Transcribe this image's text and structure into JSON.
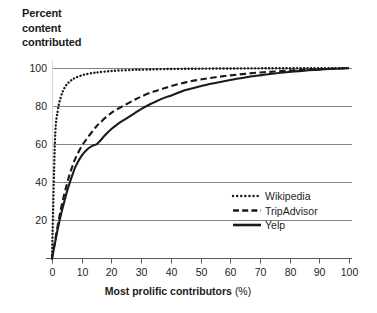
{
  "chart_data": {
    "type": "line",
    "title": "Percent content contributed",
    "title_lines": [
      "Percent",
      "content",
      "contributed"
    ],
    "xlabel": "Most prolific contributors",
    "xlabel_unit": "(%)",
    "ylabel": "Percent content contributed",
    "xlim": [
      0,
      100
    ],
    "ylim": [
      0,
      104
    ],
    "grid": "horizontal",
    "legend_position": "bottom-right",
    "x_ticks": [
      0,
      10,
      20,
      30,
      40,
      50,
      60,
      70,
      80,
      90,
      100
    ],
    "x_tick_labels": [
      "0",
      "10",
      "20",
      "30",
      "40",
      "50",
      "60",
      "70",
      "80",
      "90",
      "100"
    ],
    "y_ticks": [
      20,
      40,
      60,
      80,
      100
    ],
    "y_tick_labels": [
      "20",
      "40",
      "60",
      "80",
      "100"
    ],
    "x": [
      0,
      1,
      2,
      3,
      4,
      5,
      6,
      7,
      8,
      10,
      12,
      14,
      15,
      16,
      18,
      20,
      22,
      25,
      28,
      30,
      33,
      35,
      38,
      40,
      45,
      50,
      55,
      60,
      65,
      70,
      75,
      80,
      85,
      90,
      95,
      100
    ],
    "series": [
      {
        "name": "Wikipedia",
        "style": "dotted",
        "color": "#1a1a1a",
        "values": [
          0,
          62,
          78,
          85,
          89,
          91.5,
          93,
          94.2,
          95,
          96.2,
          97,
          97.5,
          97.7,
          97.9,
          98.2,
          98.5,
          98.7,
          98.9,
          99.1,
          99.2,
          99.3,
          99.4,
          99.5,
          99.55,
          99.65,
          99.72,
          99.78,
          99.82,
          99.86,
          99.89,
          99.92,
          99.94,
          99.96,
          99.97,
          99.99,
          100
        ]
      },
      {
        "name": "TripAdvisor",
        "style": "dashed",
        "color": "#1a1a1a",
        "values": [
          0,
          9,
          18,
          26,
          33,
          39,
          44.5,
          49,
          53,
          59,
          63.5,
          67.5,
          69.5,
          71,
          74,
          76.5,
          78.5,
          81,
          83.5,
          85,
          87,
          88,
          89.5,
          90.5,
          92.5,
          94,
          95.2,
          96.2,
          97,
          97.7,
          98.2,
          98.7,
          99.1,
          99.4,
          99.7,
          100
        ]
      },
      {
        "name": "Yelp",
        "style": "solid",
        "color": "#1a1a1a",
        "values": [
          0,
          8,
          16,
          23,
          29,
          35,
          40,
          44.5,
          48.5,
          54,
          57.5,
          59.5,
          60,
          61.5,
          65,
          68,
          70.5,
          73.5,
          76.5,
          78.5,
          81,
          82.5,
          84.5,
          85.5,
          88.5,
          90.5,
          92.2,
          93.8,
          95.1,
          96.2,
          97.2,
          98,
          98.7,
          99.2,
          99.7,
          100
        ]
      }
    ]
  },
  "legend": {
    "items": [
      {
        "label": "Wikipedia",
        "style": "dotted"
      },
      {
        "label": "TripAdvisor",
        "style": "dashed"
      },
      {
        "label": "Yelp",
        "style": "solid"
      }
    ]
  }
}
